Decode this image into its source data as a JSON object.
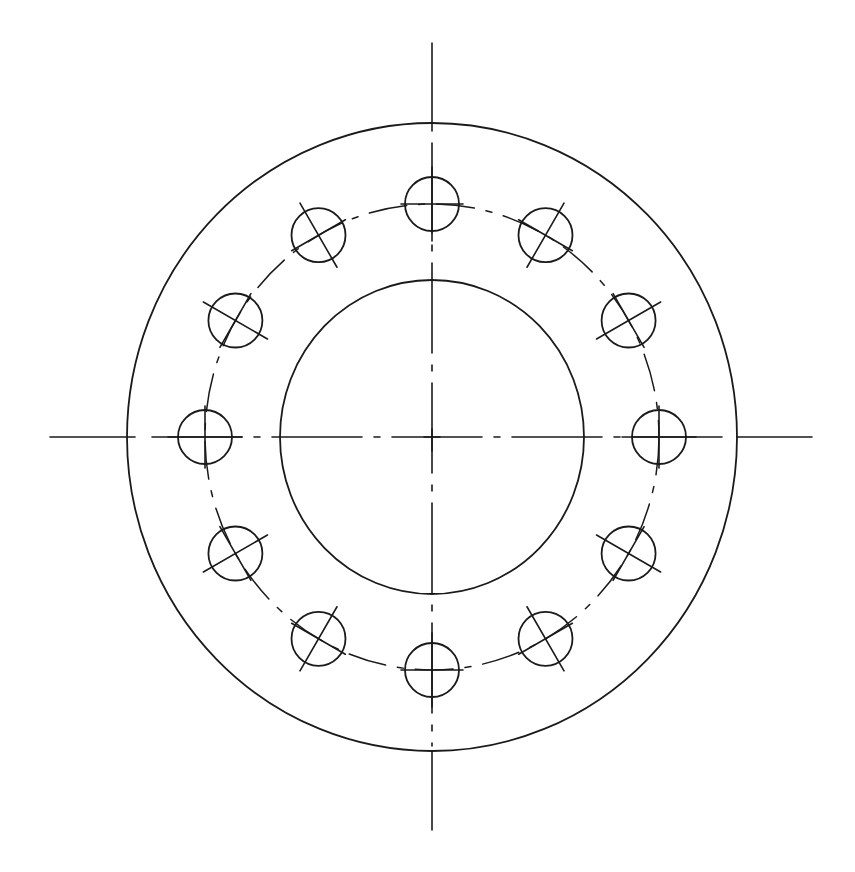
{
  "drawing": {
    "title": "Flange with 12-hole bolt circle",
    "type": "technical-drawing",
    "stroke_color": "#1a1a1a",
    "background_color": "#ffffff",
    "center": {
      "x": 432,
      "y": 437
    },
    "outer_circle": {
      "rx": 305,
      "ry": 314
    },
    "inner_bore": {
      "rx": 152,
      "ry": 157
    },
    "bolt_circle": {
      "rx": 227,
      "ry": 233,
      "line_style": "dash-dot"
    },
    "bolt_holes": {
      "count": 12,
      "radius": 27,
      "angles_deg": [
        90,
        60,
        30,
        0,
        -30,
        -60,
        -90,
        -120,
        -150,
        180,
        150,
        120
      ],
      "has_centerlines": true
    },
    "centerlines": {
      "horizontal": {
        "x1": 50,
        "x2": 812,
        "y": 437
      },
      "vertical": {
        "x": 432,
        "y1": 43,
        "y2": 830
      },
      "line_style": "dash-dot inside outer circle, solid outside"
    }
  }
}
